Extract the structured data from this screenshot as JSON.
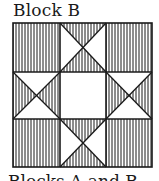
{
  "figure": {
    "title": "Block B",
    "caption": "Blocks A and B",
    "block": {
      "grid": "3x3",
      "pattern": "ohio-star-variant",
      "fill_style": "vertical-stripes",
      "stroke_color": "#1a1a1a",
      "background": "#ffffff",
      "cells": [
        {
          "row": 0,
          "col": 0,
          "type": "solid-striped"
        },
        {
          "row": 0,
          "col": 1,
          "type": "hourglass-striped-top-bottom"
        },
        {
          "row": 0,
          "col": 2,
          "type": "solid-striped"
        },
        {
          "row": 1,
          "col": 0,
          "type": "hourglass-striped-left-right"
        },
        {
          "row": 1,
          "col": 1,
          "type": "plain"
        },
        {
          "row": 1,
          "col": 2,
          "type": "hourglass-striped-left-right"
        },
        {
          "row": 2,
          "col": 0,
          "type": "solid-striped"
        },
        {
          "row": 2,
          "col": 1,
          "type": "hourglass-striped-top-bottom"
        },
        {
          "row": 2,
          "col": 2,
          "type": "solid-striped"
        }
      ]
    }
  }
}
